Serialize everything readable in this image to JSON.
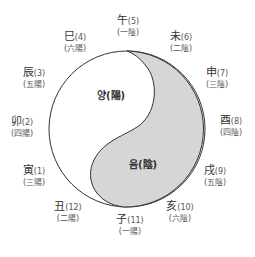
{
  "diagram": {
    "title": "",
    "colors": {
      "yin_fill": "#d6d6d6",
      "yang_fill": "#ffffff",
      "outline": "#333333"
    },
    "center_labels": {
      "yang": "양(陽)",
      "yin": "음(陰)"
    },
    "branches": [
      {
        "char": "午",
        "num": "(5)",
        "phase": "(一陰)",
        "x": 128,
        "y": 15
      },
      {
        "char": "未",
        "num": "(6)",
        "phase": "(二陰)",
        "x": 181,
        "y": 31
      },
      {
        "char": "申",
        "num": "(7)",
        "phase": "(三陰)",
        "x": 217,
        "y": 67
      },
      {
        "char": "酉",
        "num": "(8)",
        "phase": "(四陰)",
        "x": 231,
        "y": 115
      },
      {
        "char": "戌",
        "num": "(9)",
        "phase": "(五陰)",
        "x": 215,
        "y": 165
      },
      {
        "char": "亥",
        "num": "(10)",
        "phase": "(六陰)",
        "x": 180,
        "y": 201
      },
      {
        "char": "子",
        "num": "(11)",
        "phase": "(一陽)",
        "x": 130,
        "y": 214
      },
      {
        "char": "丑",
        "num": "(12)",
        "phase": "(二陽)",
        "x": 68,
        "y": 201
      },
      {
        "char": "寅",
        "num": "(1)",
        "phase": "(三陽)",
        "x": 34,
        "y": 165
      },
      {
        "char": "卯",
        "num": "(2)",
        "phase": "(四陽)",
        "x": 22,
        "y": 116
      },
      {
        "char": "辰",
        "num": "(3)",
        "phase": "(五陽)",
        "x": 34,
        "y": 67
      },
      {
        "char": "巳",
        "num": "(4)",
        "phase": "(六陽)",
        "x": 75,
        "y": 31
      }
    ]
  }
}
